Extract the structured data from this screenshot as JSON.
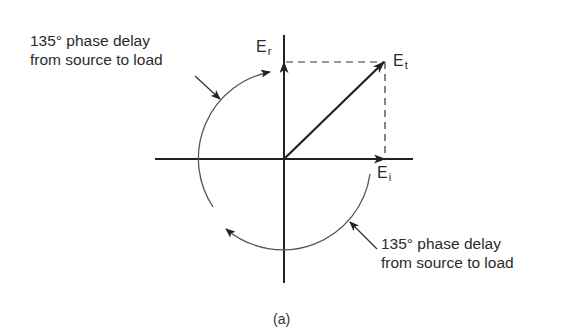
{
  "figure": {
    "caption": "(a)",
    "annotations": {
      "upper": {
        "line1": "135° phase delay",
        "line2": "from source to load"
      },
      "lower": {
        "line1": "135° phase delay",
        "line2": "from source to load"
      }
    },
    "vectors": {
      "incident": {
        "symbol": "E",
        "subscript": "i"
      },
      "reflected": {
        "symbol": "E",
        "subscript": "r"
      },
      "total": {
        "symbol": "E",
        "subscript": "t"
      }
    },
    "colors": {
      "ink": "#222222",
      "arc": "#555555"
    }
  }
}
